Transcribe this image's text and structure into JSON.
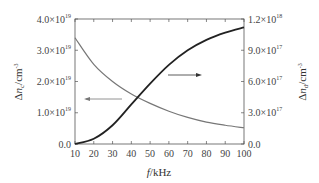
{
  "chart_data": {
    "type": "line",
    "title": "",
    "xlabel": "f/kHz",
    "ylabel_left": "Δn_c/cm^-3",
    "ylabel_right": "Δn_d/cm^-3",
    "xlim": [
      10,
      100
    ],
    "ylim_left": [
      0,
      4e+19
    ],
    "ylim_right": [
      0,
      1.2e+18
    ],
    "x_ticks": [
      "10",
      "20",
      "30",
      "40",
      "50",
      "60",
      "70",
      "80",
      "90",
      "100"
    ],
    "y_ticks_left": [
      "0.0",
      "1.0×10^19",
      "2.0×10^19",
      "3.0×10^19",
      "4.0×10^19"
    ],
    "y_ticks_right": [
      "0.0",
      "3.0×10^17",
      "6.0×10^17",
      "9.0×10^17",
      "1.2×10^18"
    ],
    "grid": false,
    "x": [
      10,
      20,
      30,
      40,
      50,
      60,
      70,
      80,
      90,
      100
    ],
    "series": [
      {
        "name": "Δn_c",
        "axis": "left",
        "color": "#777777",
        "values": [
          3.4e+19,
          2.55e+19,
          2e+19,
          1.6e+19,
          1.3e+19,
          1.05e+19,
          8.5e+18,
          7e+18,
          6e+18,
          5.2e+18
        ]
      },
      {
        "name": "Δn_d",
        "axis": "right",
        "color": "#222222",
        "values": [
          0.0,
          5e+16,
          1.8e+17,
          3.8e+17,
          5.8e+17,
          7.6e+17,
          9e+17,
          1e+18,
          1.07e+18,
          1.12e+18
        ]
      }
    ],
    "annotations": [
      {
        "type": "arrow",
        "direction": "left",
        "points_to": "left-axis",
        "series": "Δn_c"
      },
      {
        "type": "arrow",
        "direction": "right",
        "points_to": "right-axis",
        "series": "Δn_d"
      }
    ]
  },
  "labels": {
    "x_axis": "f/kHz",
    "y_left_main": "Δn",
    "y_left_sub": "c",
    "y_left_unit": "/cm",
    "y_right_main": "Δn",
    "y_right_sub": "d",
    "y_right_unit": "/cm",
    "unit_exp": "-3"
  },
  "ticks": {
    "x": [
      "10",
      "20",
      "30",
      "40",
      "50",
      "60",
      "70",
      "80",
      "90",
      "100"
    ],
    "left": [
      {
        "m": "0.0",
        "e": ""
      },
      {
        "m": "1.0×10",
        "e": "19"
      },
      {
        "m": "2.0×10",
        "e": "19"
      },
      {
        "m": "3.0×10",
        "e": "19"
      },
      {
        "m": "4.0×10",
        "e": "19"
      }
    ],
    "right": [
      {
        "m": "0.0",
        "e": ""
      },
      {
        "m": "3.0×10",
        "e": "17"
      },
      {
        "m": "6.0×10",
        "e": "17"
      },
      {
        "m": "9.0×10",
        "e": "17"
      },
      {
        "m": "1.2×10",
        "e": "18"
      }
    ]
  }
}
